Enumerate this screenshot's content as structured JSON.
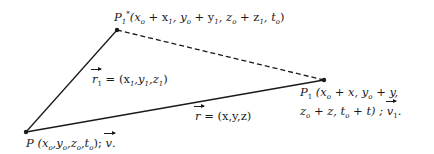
{
  "diagram": {
    "type": "vector-triangle",
    "points": {
      "P": {
        "x": 26,
        "y": 132,
        "name": "P",
        "coords": "(x0, y0, z0, t0); v."
      },
      "P1star": {
        "x": 117,
        "y": 30,
        "name": "P1*",
        "coords": "(x0 + x1, y0 + y1, z0 + z1, t0)"
      },
      "P1": {
        "x": 324,
        "y": 80,
        "name": "P1",
        "coords_line1": "(x0 + x, y0 + y,",
        "coords_line2": "z0 + z, t0 + t) ; v1."
      }
    },
    "edges": [
      {
        "from": "P",
        "to": "P1star",
        "style": "solid",
        "label": "r1 = (x1,y1,z1)"
      },
      {
        "from": "P",
        "to": "P1",
        "style": "solid",
        "label": "r = (x,y,z)"
      },
      {
        "from": "P1star",
        "to": "P1",
        "style": "dashed",
        "label": ""
      }
    ],
    "labels": {
      "p1star": {
        "name": "P",
        "sub": "1",
        "sup": "*",
        "text": "(x",
        "parts": [
          "o",
          " + x",
          "1",
          ", y",
          "o",
          " + y",
          "1",
          ", z",
          "o",
          " + z",
          "1",
          ", t",
          "o",
          ")"
        ]
      },
      "r1": {
        "vec": "r",
        "sub": "1",
        "eq": " = (x",
        "parts": [
          "1",
          ",y",
          "1",
          ",z",
          "1",
          ")"
        ]
      },
      "r": {
        "vec": "r",
        "eq": " = (x,y,z)"
      },
      "p1_line1": {
        "name": "P",
        "sub": "1",
        "text": " (x",
        "parts": [
          "o",
          " + x, y",
          "o",
          " + y,"
        ]
      },
      "p1_line2": {
        "text": "z",
        "parts": [
          "o",
          " + z, t",
          "o",
          " + t) ; "
        ],
        "vec": "v",
        "vec_sub": "1",
        "tail": "."
      },
      "p": {
        "name": "P",
        "text": " (x",
        "parts": [
          "o",
          ",y",
          "o",
          ",z",
          "o",
          ",t",
          "o",
          "); "
        ],
        "vec": "v",
        "tail": "."
      }
    },
    "colors": {
      "stroke": "#1a1a1a",
      "background": "#ffffff"
    }
  }
}
